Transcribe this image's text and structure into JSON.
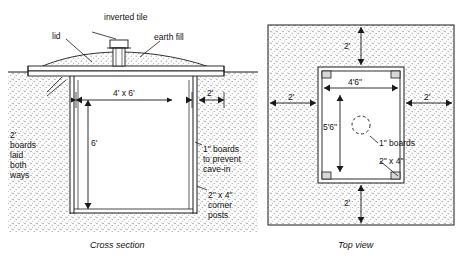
{
  "figure": {
    "title": "",
    "panels": [
      {
        "name": "cross-section",
        "caption": "Cross section",
        "labels": [
          {
            "id": "inverted-tile",
            "text": "inverted tile"
          },
          {
            "id": "lid",
            "text": "lid"
          },
          {
            "id": "earth-fill",
            "text": "earth fill"
          },
          {
            "id": "width-top",
            "text": "4' x 6'"
          },
          {
            "id": "side-offset",
            "text": "2'"
          },
          {
            "id": "depth",
            "text": "6'"
          },
          {
            "id": "boards-laid",
            "text": "2'\nboards\nlaid\nboth\nways"
          },
          {
            "id": "boards-prevent",
            "text": "1\" boards\nto prevent\ncave-in"
          },
          {
            "id": "corner-posts",
            "text": "2\" x 4\"\ncorner\nposts"
          }
        ]
      },
      {
        "name": "top-view",
        "caption": "Top view",
        "labels": [
          {
            "id": "top-margin",
            "text": "2'"
          },
          {
            "id": "inner-width",
            "text": "4'6\""
          },
          {
            "id": "left-margin",
            "text": "2'"
          },
          {
            "id": "right-margin",
            "text": "2'"
          },
          {
            "id": "inner-height",
            "text": "5'6\""
          },
          {
            "id": "boards-1in",
            "text": "1\" boards"
          },
          {
            "id": "posts-2x4",
            "text": "2\" x 4\""
          },
          {
            "id": "bottom-margin",
            "text": "2'"
          }
        ]
      }
    ],
    "colors": {
      "line": "#1a1a1a",
      "ground": "#f2f2f2",
      "stipple": "#9a9a9a",
      "background": "#ffffff"
    }
  }
}
